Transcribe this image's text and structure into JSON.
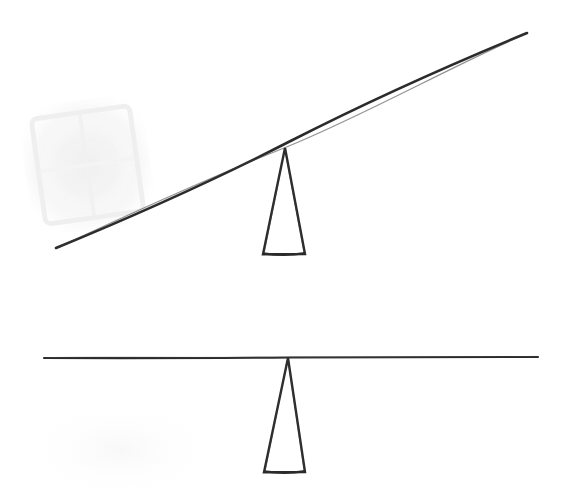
{
  "canvas": {
    "width": 563,
    "height": 499,
    "background_color": "#ffffff",
    "ink_color": "#2b2b2b",
    "ghost_color": "#f3f3f3",
    "description": "Hand-drawn pen sketch of two lever-and-fulcrum arrangements"
  },
  "figures": [
    {
      "id": "tilted-lever",
      "name": "Tilted lever on fulcrum",
      "state": "unbalanced",
      "beam": {
        "name": "tilted-beam",
        "type": "line",
        "x1": 56,
        "y1": 248,
        "x2": 527,
        "y2": 33,
        "stroke_width": 2.6,
        "tilt_direction": "right-end-up"
      },
      "fulcrum": {
        "name": "tilted-fulcrum",
        "type": "triangle",
        "apex_x": 285,
        "apex_y": 148,
        "base_left_x": 263,
        "base_right_x": 305,
        "base_y": 254,
        "stroke_width": 2.4
      }
    },
    {
      "id": "level-lever",
      "name": "Level lever on fulcrum",
      "state": "balanced",
      "beam": {
        "name": "level-beam",
        "type": "line",
        "x1": 44,
        "y1": 358,
        "x2": 538,
        "y2": 357,
        "stroke_width": 2.1,
        "tilt_direction": "horizontal"
      },
      "fulcrum": {
        "name": "level-fulcrum",
        "type": "triangle",
        "apex_x": 288,
        "apex_y": 358,
        "base_left_x": 264,
        "base_right_x": 305,
        "base_y": 472,
        "stroke_width": 2.4
      }
    }
  ],
  "artifacts": [
    {
      "name": "scan-ghost-window",
      "type": "faint-watermark",
      "x": 25,
      "y": 100,
      "width": 125,
      "height": 130,
      "rotation_deg": -8,
      "color": "#f2f2f2",
      "description": "very faint light-gray blocky window-like scan ghost in upper left"
    },
    {
      "name": "scan-ghost-lower",
      "type": "faint-smudge",
      "x": 40,
      "y": 410,
      "width": 160,
      "height": 80,
      "color": "#fbfbfb",
      "description": "barely visible smudge in lower left"
    }
  ]
}
